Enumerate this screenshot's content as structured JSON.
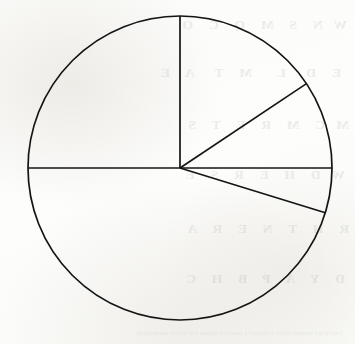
{
  "page": {
    "background_color": "#fdfdfc",
    "ink_color": "#151515",
    "width": 355,
    "height": 344
  },
  "figure": {
    "name": "pie-chart-sectors",
    "center_x": 180,
    "center_y": 168,
    "radius": 152,
    "stroke_width": 1.7
  },
  "ghost": {
    "note": "Faint mirror-reversed show-through text from the reverse side of the page",
    "opacity": 0.085,
    "lines": [
      {
        "text": "W  N   S   M   Q   C   O",
        "x": 8,
        "y": 18
      },
      {
        "text": "E   D    L     M   T    A   E",
        "x": 14,
        "y": 66
      },
      {
        "text": "M  C   M   R   E   T   S",
        "x": 6,
        "y": 118
      },
      {
        "text": "W  D   H   E   R   S   E",
        "x": 10,
        "y": 168
      },
      {
        "text": "R   H   T   N   E   R   A",
        "x": 6,
        "y": 222
      },
      {
        "text": "D   Y   A   P   B   H   C",
        "x": 10,
        "y": 272
      }
    ],
    "footer": "This page intentionally contains a practice figure for sector estimation."
  },
  "chart_data": {
    "type": "pie",
    "title": "",
    "subtitle": "",
    "xlabel": "",
    "ylabel": "",
    "grid": false,
    "legend": "none",
    "labels_shown": false,
    "values_shown": false,
    "center": [
      180,
      168
    ],
    "radius": 152,
    "start_angle_deg": 0,
    "direction": "clockwise",
    "angle_reference": "0 degrees at 12 o'clock, increasing clockwise",
    "categories": [
      "Sector 1",
      "Sector 2",
      "Sector 3",
      "Sector 4",
      "Sector 5"
    ],
    "boundary_angles_deg": [
      0,
      56.3,
      90,
      107.1,
      270
    ],
    "values": [
      56.3,
      33.7,
      17.1,
      162.9,
      90
    ],
    "values_unit": "degrees",
    "percentages": [
      15.6,
      9.4,
      4.8,
      45.3,
      25.0
    ],
    "sectors": [
      {
        "name": "Sector 1",
        "start_angle_deg": 0,
        "end_angle_deg": 56.3,
        "sweep_deg": 56.3,
        "percent": 15.6,
        "fraction": "0.156",
        "fill": "none",
        "position": "upper right, between 12 o'clock radius and upper diagonal"
      },
      {
        "name": "Sector 2",
        "start_angle_deg": 56.3,
        "end_angle_deg": 90,
        "sweep_deg": 33.7,
        "percent": 9.4,
        "fraction": "0.094",
        "fill": "none",
        "position": "right, between upper diagonal and 3 o'clock radius"
      },
      {
        "name": "Sector 3",
        "start_angle_deg": 90,
        "end_angle_deg": 107.1,
        "sweep_deg": 17.1,
        "percent": 4.8,
        "fraction": "0.048",
        "fill": "none",
        "position": "lower right, narrow wedge below horizontal"
      },
      {
        "name": "Sector 4",
        "start_angle_deg": 107.1,
        "end_angle_deg": 270,
        "sweep_deg": 162.9,
        "percent": 45.3,
        "fraction": "0.453",
        "fill": "none",
        "position": "lower left, largest sector"
      },
      {
        "name": "Sector 5",
        "start_angle_deg": 270,
        "end_angle_deg": 360,
        "sweep_deg": 90,
        "percent": 25.0,
        "fraction": "0.250",
        "fill": "none",
        "position": "upper left quadrant"
      }
    ],
    "radii": [
      {
        "name": "radius-top",
        "angle_deg": 0,
        "endpoint": [
          180,
          16
        ]
      },
      {
        "name": "radius-upper-diagonal",
        "angle_deg": 56.3,
        "endpoint": [
          306,
          84
        ]
      },
      {
        "name": "radius-right",
        "angle_deg": 90,
        "endpoint": [
          332,
          168
        ]
      },
      {
        "name": "radius-lower-diagonal",
        "angle_deg": 107.1,
        "endpoint": [
          325,
          213
        ]
      },
      {
        "name": "radius-left",
        "angle_deg": 270,
        "endpoint": [
          28,
          168
        ]
      }
    ]
  }
}
